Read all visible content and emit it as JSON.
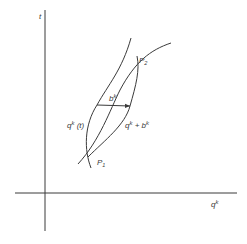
{
  "diagram": {
    "type": "phase-plane sketch",
    "axes": {
      "vertical_label": "t",
      "horizontal_label": "q",
      "horizontal_label_sup": "k"
    },
    "points": [
      {
        "id": "P2",
        "label": "P",
        "sub": "2"
      },
      {
        "id": "P1",
        "label": "P",
        "sub": "1"
      }
    ],
    "curves": [
      {
        "id": "curve-q-of-t",
        "label": "q",
        "sup": "k",
        "suffix": " (t)"
      },
      {
        "id": "curve-q-plus-b",
        "label": "q",
        "sup": "k",
        "mid": " + b",
        "sup2": "k"
      }
    ],
    "arrow": {
      "label": "b",
      "sup": "k"
    },
    "colors": {
      "line": "#3a3a3a",
      "background": "#ffffff"
    }
  }
}
